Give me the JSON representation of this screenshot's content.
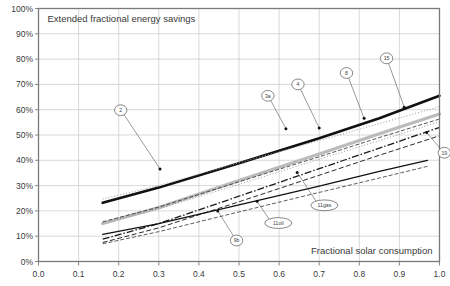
{
  "chart_data": {
    "type": "line",
    "title": "Extended fractional energy savings",
    "xlabel": "Fractional solar consumption",
    "ylabel": "Extended fractional energy savings",
    "xlim": [
      0.0,
      1.0
    ],
    "ylim": [
      0.0,
      1.0
    ],
    "grid": true,
    "legend": "none",
    "xticks": [
      "0.0",
      "0.1",
      "0.2",
      "0.3",
      "0.4",
      "0.5",
      "0.6",
      "0.7",
      "0.8",
      "0.9",
      "1.0"
    ],
    "yticks": [
      "0%",
      "10%",
      "20%",
      "30%",
      "40%",
      "50%",
      "60%",
      "70%",
      "80%",
      "90%",
      "100%"
    ],
    "xtick_values": [
      0.0,
      0.1,
      0.2,
      0.3,
      0.4,
      0.5,
      0.6,
      0.7,
      0.8,
      0.9,
      1.0
    ],
    "ytick_values": [
      0.0,
      0.1,
      0.2,
      0.3,
      0.4,
      0.5,
      0.6,
      0.7,
      0.8,
      0.9,
      1.0
    ],
    "series": [
      {
        "name": "2",
        "style": "solid-thick-black",
        "color": "#111111",
        "width": 2.6,
        "dash": "none",
        "x": [
          0.16,
          0.3,
          0.5,
          0.7,
          0.85,
          1.0
        ],
        "y": [
          0.232,
          0.292,
          0.388,
          0.487,
          0.566,
          0.655
        ]
      },
      {
        "name": "3a",
        "style": "dotted-thin-gray",
        "color": "#9a9a9a",
        "width": 1.0,
        "dash": "1,2",
        "x": [
          0.16,
          0.3,
          0.5,
          0.7,
          0.85,
          1.0
        ],
        "y": [
          0.247,
          0.3,
          0.39,
          0.478,
          0.545,
          0.612
        ]
      },
      {
        "name": "4",
        "style": "solid-thick-gray",
        "color": "#bbbbbb",
        "width": 3.2,
        "dash": "none",
        "x": [
          0.16,
          0.3,
          0.5,
          0.7,
          0.85,
          1.0
        ],
        "y": [
          0.15,
          0.213,
          0.32,
          0.425,
          0.505,
          0.583
        ]
      },
      {
        "name": "8",
        "style": "dashed-fine-black",
        "color": "#2a2a2a",
        "width": 0.8,
        "dash": "4,2",
        "x": [
          0.16,
          0.3,
          0.5,
          0.7,
          0.85,
          1.0
        ],
        "y": [
          0.157,
          0.215,
          0.315,
          0.414,
          0.49,
          0.563
        ]
      },
      {
        "name": "15",
        "style": "dashdot-black",
        "color": "#1a1a1a",
        "width": 1.3,
        "dash": "7,2,1.5,2",
        "x": [
          0.16,
          0.3,
          0.5,
          0.7,
          0.85,
          1.0
        ],
        "y": [
          0.088,
          0.15,
          0.258,
          0.367,
          0.448,
          0.53
        ]
      },
      {
        "name": "19",
        "style": "dashed-medium-black",
        "color": "#2a2a2a",
        "width": 1.0,
        "dash": "5,2.5",
        "x": [
          0.16,
          0.3,
          0.5,
          0.7,
          0.85,
          1.0
        ],
        "y": [
          0.075,
          0.133,
          0.236,
          0.341,
          0.42,
          0.497
        ]
      },
      {
        "name": "11gas",
        "style": "solid-black",
        "color": "#111111",
        "width": 1.3,
        "dash": "none",
        "x": [
          0.16,
          0.3,
          0.5,
          0.7,
          0.85,
          0.97
        ],
        "y": [
          0.107,
          0.15,
          0.224,
          0.298,
          0.356,
          0.4
        ]
      },
      {
        "name": "11oil",
        "style": "dashed-thin-black",
        "color": "#333333",
        "width": 0.8,
        "dash": "4,2",
        "x": [
          0.16,
          0.3,
          0.5,
          0.7,
          0.85,
          0.97
        ],
        "y": [
          0.07,
          0.118,
          0.196,
          0.273,
          0.33,
          0.376
        ]
      },
      {
        "name": "9b",
        "style": "dotted-gray",
        "color": "#8d8d8d",
        "width": 0.9,
        "dash": "1,2",
        "x": [
          0.16,
          0.3,
          0.5,
          0.7,
          0.85,
          1.0
        ],
        "y": [
          0.152,
          0.208,
          0.305,
          0.404,
          0.478,
          0.552
        ]
      }
    ],
    "annotations": [
      {
        "label": "2",
        "shape": "circle",
        "cx": 0.205,
        "cy": 0.598,
        "tx": 0.303,
        "ty": 0.366
      },
      {
        "label": "3a",
        "shape": "circle",
        "cx": 0.572,
        "cy": 0.655,
        "tx": 0.617,
        "ty": 0.525
      },
      {
        "label": "4",
        "shape": "circle",
        "cx": 0.647,
        "cy": 0.7,
        "tx": 0.7,
        "ty": 0.528
      },
      {
        "label": "8",
        "shape": "circle",
        "cx": 0.768,
        "cy": 0.745,
        "tx": 0.812,
        "ty": 0.566
      },
      {
        "label": "15",
        "shape": "circle",
        "cx": 0.868,
        "cy": 0.803,
        "tx": 0.912,
        "ty": 0.61
      },
      {
        "label": "19",
        "shape": "circle",
        "cx": 1.012,
        "cy": 0.43,
        "tx": 0.968,
        "ty": 0.51
      },
      {
        "label": "11gas",
        "shape": "ellipse",
        "cx": 0.713,
        "cy": 0.222,
        "tx": 0.645,
        "ty": 0.352
      },
      {
        "label": "11oil",
        "shape": "ellipse",
        "cx": 0.598,
        "cy": 0.152,
        "tx": 0.545,
        "ty": 0.238
      },
      {
        "label": "9b",
        "shape": "circle",
        "cx": 0.494,
        "cy": 0.083,
        "tx": 0.447,
        "ty": 0.2
      }
    ]
  },
  "plot_title_text": "Extended fractional energy savings",
  "x_axis_caption": "Fractional solar consumption",
  "colors": {
    "grid": "#c9c9c9",
    "frame": "#7a7a7a",
    "text": "#3a3a3a",
    "accent_black": "#111111",
    "accent_gray": "#bbbbbb"
  }
}
